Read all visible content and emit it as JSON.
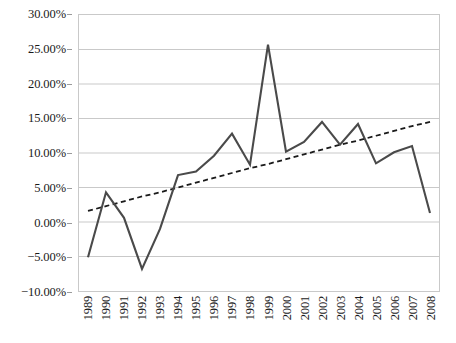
{
  "chart_data": {
    "type": "line",
    "title": "",
    "subtitle": "",
    "xlabel": "",
    "ylabel": "",
    "grid": true,
    "legend_position": "none",
    "ylim": [
      -10,
      30
    ],
    "ytick_values": [
      30,
      25,
      20,
      15,
      10,
      5,
      0,
      -5,
      -10
    ],
    "ytick_labels": [
      "30.00%",
      "25.00%",
      "20.00%",
      "15.00%",
      "10.00%",
      "5.00%",
      "0.00%",
      "−5.00%",
      "−10.00%"
    ],
    "categories": [
      "1989",
      "1990",
      "1991",
      "1992",
      "1993",
      "1994",
      "1995",
      "1996",
      "1997",
      "1998",
      "1999",
      "2000",
      "2001",
      "2002",
      "2003",
      "2004",
      "2005",
      "2006",
      "2007",
      "2008"
    ],
    "series": [
      {
        "name": "data",
        "style": "solid",
        "color": "#4a4a4a",
        "values": [
          -5.1,
          4.3,
          0.6,
          -6.8,
          -1.0,
          6.8,
          7.3,
          9.6,
          12.8,
          8.3,
          25.7,
          10.2,
          11.6,
          14.5,
          11.2,
          14.2,
          8.5,
          10.1,
          11.0,
          1.3
        ]
      },
      {
        "name": "trendline",
        "style": "dashed",
        "color": "#1a1a1a",
        "values": [
          1.6,
          2.3,
          3.0,
          3.7,
          4.3,
          5.0,
          5.7,
          6.4,
          7.1,
          7.8,
          8.4,
          9.1,
          9.8,
          10.5,
          11.2,
          11.8,
          12.5,
          13.2,
          13.9,
          14.5
        ]
      }
    ],
    "colors": {
      "series_line": "#4a4a4a",
      "trend_line": "#1a1a1a",
      "gridline": "#c9c9c9",
      "axis_text": "#1a1a1a",
      "plot_background": "#ffffff"
    }
  }
}
